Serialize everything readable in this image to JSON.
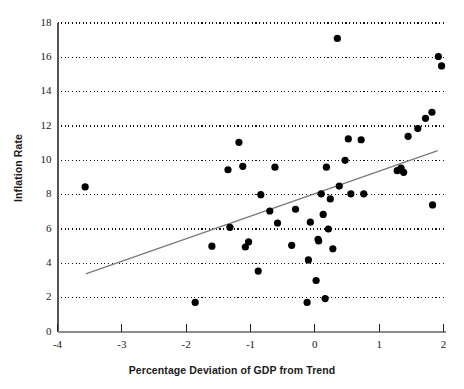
{
  "chart_data": {
    "type": "scatter",
    "title": "",
    "xlabel": "Percentage Deviation of GDP from Trend",
    "ylabel": "Inflation Rate",
    "xlim": [
      -4,
      2
    ],
    "ylim": [
      0,
      18
    ],
    "xticks": [
      -4,
      -3,
      -2,
      -1,
      0,
      1,
      2
    ],
    "xtick_labels": [
      "-4",
      "-3",
      "-2",
      "-1",
      "0",
      "1",
      "2"
    ],
    "yticks": [
      0,
      2,
      4,
      6,
      8,
      10,
      12,
      14,
      16,
      18
    ],
    "ytick_labels": [
      "0",
      "2",
      "4",
      "6",
      "8",
      "10",
      "12",
      "14",
      "16",
      "18"
    ],
    "grid": "horizontal-dotted",
    "grid_color": "#111111",
    "legend": "none",
    "marker_color": "#000000",
    "marker_size": 4.4,
    "points": [
      [
        -3.57,
        8.45
      ],
      [
        -1.86,
        1.72
      ],
      [
        -1.6,
        5.0
      ],
      [
        -1.35,
        9.45
      ],
      [
        -1.32,
        6.1
      ],
      [
        -1.18,
        11.05
      ],
      [
        -1.12,
        9.65
      ],
      [
        -1.08,
        4.95
      ],
      [
        -1.03,
        5.25
      ],
      [
        -0.88,
        3.55
      ],
      [
        -0.84,
        8.0
      ],
      [
        -0.7,
        7.05
      ],
      [
        -0.62,
        9.6
      ],
      [
        -0.58,
        6.35
      ],
      [
        -0.36,
        5.05
      ],
      [
        -0.3,
        7.15
      ],
      [
        -0.12,
        1.72
      ],
      [
        -0.1,
        4.2
      ],
      [
        -0.07,
        6.4
      ],
      [
        0.02,
        3.0
      ],
      [
        0.05,
        5.4
      ],
      [
        0.06,
        5.3
      ],
      [
        0.1,
        8.05
      ],
      [
        0.13,
        6.85
      ],
      [
        0.16,
        1.95
      ],
      [
        0.18,
        9.6
      ],
      [
        0.21,
        6.0
      ],
      [
        0.24,
        7.75
      ],
      [
        0.28,
        4.85
      ],
      [
        0.35,
        17.1
      ],
      [
        0.38,
        8.5
      ],
      [
        0.47,
        10.0
      ],
      [
        0.52,
        11.25
      ],
      [
        0.56,
        8.05
      ],
      [
        0.72,
        11.2
      ],
      [
        0.76,
        8.05
      ],
      [
        1.28,
        9.4
      ],
      [
        1.34,
        9.55
      ],
      [
        1.38,
        9.3
      ],
      [
        1.45,
        11.4
      ],
      [
        1.6,
        11.85
      ],
      [
        1.72,
        12.45
      ],
      [
        1.82,
        12.8
      ],
      [
        1.83,
        7.4
      ],
      [
        1.92,
        16.05
      ],
      [
        1.97,
        15.5
      ]
    ],
    "trendline": {
      "name": "fitted regression line",
      "color": "#7b7b7b",
      "x_start": -3.55,
      "y_start": 3.4,
      "x_end": 1.9,
      "y_end": 10.55
    }
  },
  "axes": {
    "x_title": "Percentage Deviation of GDP from Trend",
    "y_title": "Inflation Rate"
  }
}
